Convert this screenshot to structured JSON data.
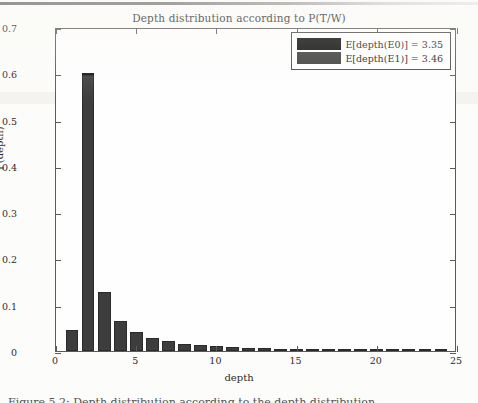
{
  "chart_data": {
    "type": "bar",
    "title": "Depth distribution according to P(T/W)",
    "xlabel": "depth",
    "ylabel": "P(depth)",
    "xlim": [
      0,
      25
    ],
    "ylim": [
      0,
      0.7
    ],
    "xticks": [
      0,
      5,
      10,
      15,
      20,
      25
    ],
    "yticks": [
      "0",
      "0.1",
      "0.2",
      "0.3",
      "0.4",
      "0.5",
      "0.6",
      "0.7"
    ],
    "ytick_values": [
      0,
      0.1,
      0.2,
      0.3,
      0.4,
      0.5,
      0.6,
      0.7
    ],
    "grid": false,
    "legend_position": "upper right",
    "x": [
      1,
      2,
      3,
      4,
      5,
      6,
      7,
      8,
      9,
      10,
      11,
      12,
      13,
      14,
      15,
      16,
      17,
      18,
      19,
      20,
      21,
      22,
      23,
      24
    ],
    "series": [
      {
        "name": "E[depth(E0)] = 3.35",
        "color": "#0d0d0d",
        "values": [
          0.045,
          0.6,
          0.126,
          0.064,
          0.041,
          0.029,
          0.021,
          0.015,
          0.012,
          0.01,
          0.008,
          0.007,
          0.006,
          0.005,
          0.005,
          0.004,
          0.003,
          0.003,
          0.002,
          0.002,
          0.002,
          0.001,
          0.001,
          0.001
        ]
      },
      {
        "name": "E[depth(E1)] = 3.46",
        "color": "#3d3d3d",
        "values": [
          0.045,
          0.597,
          0.127,
          0.065,
          0.042,
          0.029,
          0.021,
          0.015,
          0.012,
          0.01,
          0.008,
          0.007,
          0.006,
          0.005,
          0.005,
          0.004,
          0.003,
          0.003,
          0.002,
          0.002,
          0.002,
          0.001,
          0.001,
          0.001
        ]
      }
    ]
  },
  "legend": {
    "entries": [
      {
        "label": "E[depth(E0)] = 3.35",
        "swatch": "e0"
      },
      {
        "label": "E[depth(E1)] = 3.46",
        "swatch": "e1"
      }
    ]
  },
  "caption": {
    "fragment": "Figure 5.2: Depth distribution according to the depth distribution"
  }
}
